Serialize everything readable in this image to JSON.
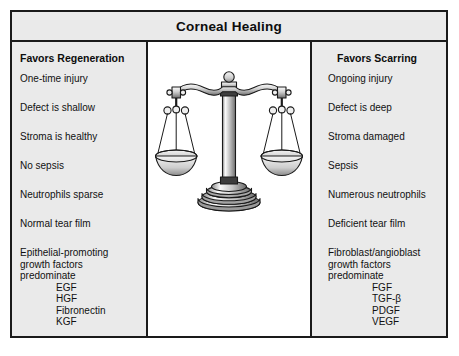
{
  "figure": {
    "title": "Corneal Healing",
    "frame_border_color": "#1a1a1a",
    "column_background": "#eaeaea",
    "center_background": "#ffffff"
  },
  "left_column": {
    "heading": "Favors Regeneration",
    "entries": [
      "One-time injury",
      "Defect is shallow",
      "Stroma is healthy",
      "No sepsis",
      "Neutrophils sparse",
      "Normal tear film"
    ],
    "growth_factor_block": {
      "lead_lines": [
        "Epithelial-promoting",
        "growth factors",
        "predominate"
      ],
      "factors": [
        "EGF",
        "HGF",
        "Fibronectin",
        "KGF"
      ]
    }
  },
  "right_column": {
    "heading": "Favors Scarring",
    "entries": [
      "Ongoing injury",
      "Defect is deep",
      "Stroma damaged",
      "Sepsis",
      "Numerous neutrophils",
      "Deficient tear film"
    ],
    "growth_factor_block": {
      "lead_lines": [
        "Fibroblast/angioblast",
        "growth factors",
        "predominate"
      ],
      "factors": [
        "FGF",
        "TGF-β",
        "PDGF",
        "VEGF"
      ]
    }
  },
  "center_panel": {
    "illustration_name": "balance-scale",
    "illustration_state": "balanced",
    "pan_count": 2,
    "colors": {
      "outline": "#1a1a1a",
      "metal_light": "#f2f2f2",
      "metal_mid": "#b8b8b8",
      "metal_dark": "#7a7a7a",
      "pan_fill": "#d9d9d9"
    }
  }
}
